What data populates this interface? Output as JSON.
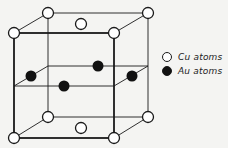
{
  "figure": {
    "colors": {
      "cu_fill": "#ffffff",
      "au_fill": "#111111",
      "line": "#1a1a1a",
      "background": "#f4f4f2"
    }
  },
  "legend": {
    "items": [
      {
        "label": "Cu atoms",
        "symbol": "open-circle"
      },
      {
        "label": "Au atoms",
        "symbol": "filled-circle"
      }
    ]
  },
  "atoms": {
    "cu": [
      [
        14,
        33
      ],
      [
        114,
        33
      ],
      [
        14,
        138
      ],
      [
        114,
        138
      ],
      [
        48,
        13
      ],
      [
        148,
        13
      ],
      [
        48,
        117
      ],
      [
        148,
        117
      ],
      [
        81,
        24
      ],
      [
        81,
        128
      ]
    ],
    "au": [
      [
        31,
        76
      ],
      [
        64,
        86
      ],
      [
        98,
        66
      ],
      [
        132,
        76
      ]
    ]
  }
}
